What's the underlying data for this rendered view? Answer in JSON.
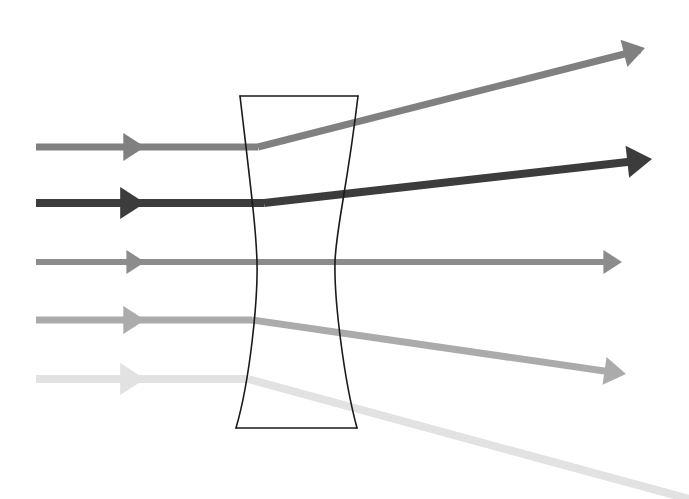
{
  "figure": {
    "type": "optics-ray-diagram",
    "width": 689,
    "height": 499,
    "background_color": "#ffffff"
  },
  "lens": {
    "name": "biconcave-diverging-lens",
    "shape": "biconcave",
    "outline_color": "#1a1a1a",
    "outline_width": 1.6,
    "fill": "none",
    "top_edge": {
      "left_x": 240,
      "right_x": 358,
      "y": 96
    },
    "bottom_edge": {
      "left_x": 236,
      "right_x": 357,
      "y": 428
    },
    "waist": {
      "left_x": 256,
      "right_x": 335,
      "y": 262
    },
    "left_surface_path": "M 240 96 C 251 190 256 228 257 262 C 258 300 250 380 236 428",
    "right_surface_path": "M 358 96 C 347 190 336 228 335 262 C 334 300 344 380 357 428"
  },
  "axis": {
    "name": "optical-axis",
    "y": 262
  },
  "rays": [
    {
      "id": "ray-1",
      "label": "Ray 1",
      "color": "#808080",
      "width": 7,
      "incoming": {
        "x1": 36,
        "y1": 147,
        "x2": 258,
        "y2": 147
      },
      "outgoing": {
        "x1": 258,
        "y1": 147,
        "x2": 640,
        "y2": 50
      },
      "arrow_mid": {
        "x": 145,
        "y": 147,
        "angle": 0
      },
      "arrow_end": {
        "x": 645,
        "y": 48,
        "angle": -14.2
      },
      "deflection": "upward"
    },
    {
      "id": "ray-2",
      "label": "Ray 2",
      "color": "#3c3c3c",
      "width": 8,
      "incoming": {
        "x1": 36,
        "y1": 203,
        "x2": 264,
        "y2": 203
      },
      "outgoing": {
        "x1": 264,
        "y1": 203,
        "x2": 645,
        "y2": 160
      },
      "arrow_mid": {
        "x": 145,
        "y": 203,
        "angle": 0
      },
      "arrow_end": {
        "x": 652,
        "y": 159,
        "angle": -6.4
      },
      "deflection": "upward"
    },
    {
      "id": "ray-3",
      "label": "Ray 3",
      "color": "#8c8c8c",
      "width": 6,
      "incoming": {
        "x1": 36,
        "y1": 262,
        "x2": 262,
        "y2": 262
      },
      "outgoing": {
        "x1": 262,
        "y1": 262,
        "x2": 615,
        "y2": 262
      },
      "arrow_mid": {
        "x": 145,
        "y": 262,
        "angle": 0
      },
      "arrow_end": {
        "x": 622,
        "y": 262,
        "angle": 0
      },
      "deflection": "none"
    },
    {
      "id": "ray-4",
      "label": "Ray 4",
      "color": "#ababab",
      "width": 7,
      "incoming": {
        "x1": 36,
        "y1": 320,
        "x2": 252,
        "y2": 320
      },
      "outgoing": {
        "x1": 252,
        "y1": 320,
        "x2": 618,
        "y2": 373
      },
      "arrow_mid": {
        "x": 145,
        "y": 320,
        "angle": 0
      },
      "arrow_end": {
        "x": 626,
        "y": 374,
        "angle": 8.2
      },
      "deflection": "downward"
    },
    {
      "id": "ray-5",
      "label": "Ray 5",
      "color": "#e2e2e2",
      "width": 8,
      "incoming": {
        "x1": 36,
        "y1": 379,
        "x2": 248,
        "y2": 379
      },
      "outgoing": {
        "x1": 248,
        "y1": 379,
        "x2": 689,
        "y2": 499
      },
      "arrow_mid": {
        "x": 145,
        "y": 379,
        "angle": 0
      },
      "arrow_end": null,
      "deflection": "downward"
    }
  ],
  "legend": {
    "visible": false,
    "items": []
  },
  "annotations": []
}
